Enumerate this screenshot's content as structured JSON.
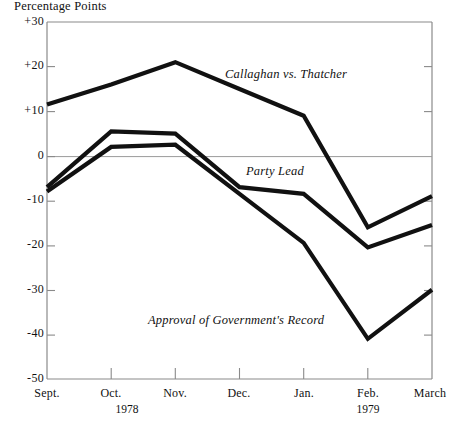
{
  "chart_data": {
    "type": "line",
    "title": "",
    "ylabel": "Percentage Points",
    "xlabel": "",
    "ylim": [
      -50,
      30
    ],
    "xlim": [
      0,
      6
    ],
    "grid": false,
    "zero_line": true,
    "legend": "inline-annotations",
    "categories": [
      "Sept.",
      "Oct.",
      "Nov.",
      "Dec.",
      "Jan.",
      "Feb.",
      "March"
    ],
    "year_markers": [
      {
        "label": "1978",
        "under_category": "Oct."
      },
      {
        "label": "1979",
        "under_category": "Feb."
      }
    ],
    "yticks": [
      "+30",
      "+20",
      "+10",
      "0",
      "-10",
      "-20",
      "-30",
      "-40",
      "-50"
    ],
    "ytick_values": [
      30,
      20,
      10,
      0,
      -10,
      -20,
      -30,
      -40,
      -50
    ],
    "series": [
      {
        "name": "Callaghan vs. Thatcher",
        "values": [
          11.5,
          16,
          21,
          15,
          9,
          -16,
          -9
        ]
      },
      {
        "name": "Party Lead",
        "values": [
          -7,
          5.5,
          5,
          -7,
          -8.5,
          -20.5,
          -15.5
        ]
      },
      {
        "name": "Approval of Government's Record",
        "values": [
          -8,
          2,
          2.5,
          -8.5,
          -19.5,
          -41,
          -30
        ]
      }
    ]
  },
  "annotations": {
    "callaghan_label": "Callaghan vs. Thatcher",
    "party_lead_label": "Party Lead",
    "approval_label": "Approval of Government's Record"
  },
  "axis": {
    "ylabel": "Percentage Points"
  }
}
